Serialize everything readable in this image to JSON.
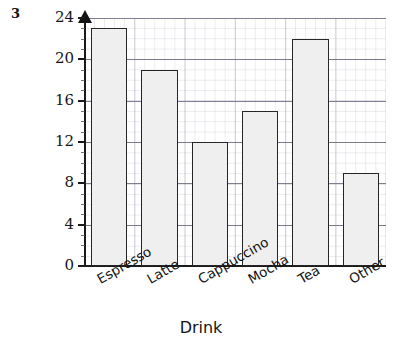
{
  "question_number": "3",
  "chart_data": {
    "type": "bar",
    "title": "",
    "xlabel": "Drink",
    "ylabel": "Frequency",
    "categories": [
      "Espresso",
      "Latte",
      "Cappuccino",
      "Mocha",
      "Tea",
      "Other"
    ],
    "values": [
      23,
      19,
      12,
      15,
      22,
      9
    ],
    "ylim": [
      0,
      24
    ],
    "yticks": [
      0,
      4,
      8,
      12,
      16,
      20,
      24
    ],
    "ytick_labels": [
      "0",
      "4",
      "8",
      "12",
      "16",
      "20",
      "24"
    ],
    "minor_tick_step": 1,
    "grid": true,
    "grid_style": "graph-paper",
    "legend": null,
    "bar_fill_color": "#efefef",
    "bar_edge_color": "#262626",
    "axis_color": "#1a1a1a",
    "y_axis_arrow": true,
    "xtick_label_rotation": -30
  }
}
